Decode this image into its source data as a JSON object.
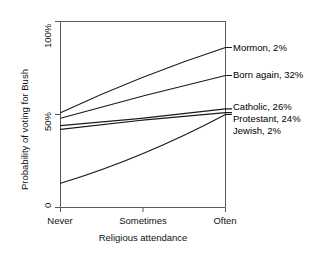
{
  "chart_data": {
    "type": "line",
    "title": "",
    "xlabel": "Religious attendance",
    "ylabel": "Probability of voting for Bush",
    "x_categories": [
      "Never",
      "Sometimes",
      "Often"
    ],
    "x_values": [
      0,
      1,
      2
    ],
    "y_ticks": [
      0,
      50,
      100
    ],
    "y_tick_labels": [
      "0",
      "50%",
      "100%"
    ],
    "ylim": [
      0,
      100
    ],
    "xlim": [
      0,
      2
    ],
    "grid": false,
    "legend_position": "right-inline-labels",
    "series": [
      {
        "name": "Mormon",
        "label": "Mormon, 2%",
        "share": "2%",
        "values": [
          51,
          70,
          86
        ],
        "color": "#1a1a1a"
      },
      {
        "name": "Born again",
        "label": "Born again, 32%",
        "share": "32%",
        "values": [
          48,
          60,
          71
        ],
        "color": "#1a1a1a"
      },
      {
        "name": "Catholic",
        "label": "Catholic, 26%",
        "share": "26%",
        "values": [
          44,
          48,
          53
        ],
        "color": "#1a1a1a"
      },
      {
        "name": "Protestant",
        "label": "Protestant, 24%",
        "share": "24%",
        "values": [
          42,
          47,
          51
        ],
        "color": "#1a1a1a"
      },
      {
        "name": "Jewish",
        "label": "Jewish, 2%",
        "share": "2%",
        "values": [
          13,
          29,
          50
        ],
        "color": "#1a1a1a"
      }
    ]
  },
  "axes": {
    "y_title": "Probability of voting for Bush",
    "x_title": "Religious attendance",
    "y_tick_0": "0",
    "y_tick_50": "50%",
    "y_tick_100": "100%",
    "x_tick_never": "Never",
    "x_tick_sometimes": "Sometimes",
    "x_tick_often": "Often"
  },
  "labels": {
    "mormon": "Mormon, 2%",
    "born_again": "Born again, 32%",
    "catholic": "Catholic, 26%",
    "protestant": "Protestant, 24%",
    "jewish": "Jewish, 2%"
  },
  "colors": {
    "line": "#1a1a1a",
    "axis": "#555c5f",
    "text": "#111111",
    "background": "#ffffff"
  }
}
